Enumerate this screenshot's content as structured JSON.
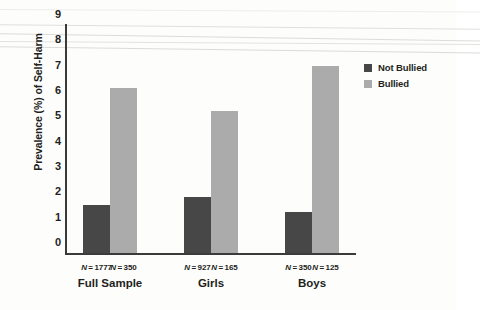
{
  "chart_data": {
    "type": "bar",
    "title": "",
    "xlabel": "",
    "ylabel": "Prevalence (%) of Self-Harm",
    "ylim": [
      0,
      9
    ],
    "ytick_labels": [
      "0",
      "1",
      "2",
      "3",
      "4",
      "5",
      "6",
      "7",
      "8",
      "9"
    ],
    "grid": false,
    "legend_position": "right",
    "categories": [
      "Full Sample",
      "Girls",
      "Boys"
    ],
    "series": [
      {
        "name": "Not Bullied",
        "color": "#474747",
        "values": [
          1.9,
          2.2,
          1.6
        ],
        "n_labels": [
          "N = 1777",
          "N = 927",
          "N = 350"
        ]
      },
      {
        "name": "Bullied",
        "color": "#ababab",
        "values": [
          6.5,
          5.6,
          7.4
        ],
        "n_labels": [
          "N = 350",
          "N = 165",
          "N = 125"
        ]
      }
    ]
  },
  "legend": {
    "items": [
      {
        "label": "Not Bullied",
        "color": "#474747"
      },
      {
        "label": "Bullied",
        "color": "#ababab"
      }
    ]
  },
  "axis": {
    "y_title": "Prevalence (%) of Self-Harm"
  }
}
